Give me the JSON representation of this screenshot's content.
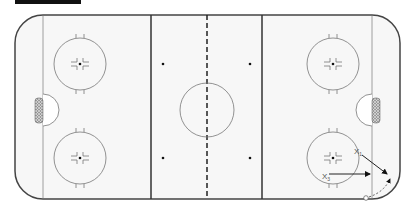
{
  "diagram": {
    "type": "hockey-rink-drill",
    "players": [
      {
        "label": "X",
        "sub": "1"
      },
      {
        "label": "X",
        "sub": "3"
      }
    ],
    "colors": {
      "line": "#555555",
      "border": "#333333",
      "rink_bg": "#f7f7f7"
    }
  }
}
